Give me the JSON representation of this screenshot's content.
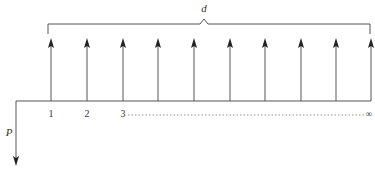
{
  "diagram": {
    "type": "cash-flow-diagram",
    "colors": {
      "line": "#555555",
      "arrow": "#222222",
      "text": "#333333",
      "dotted": "#777777"
    },
    "bracket_label": "d",
    "present_value_label": "P",
    "period_labels": [
      "1",
      "2",
      "3"
    ],
    "end_label": "∞",
    "num_receipt_arrows": 10,
    "arrow_x": [
      51,
      87,
      123,
      158,
      194,
      230,
      265,
      301,
      336,
      371
    ]
  }
}
